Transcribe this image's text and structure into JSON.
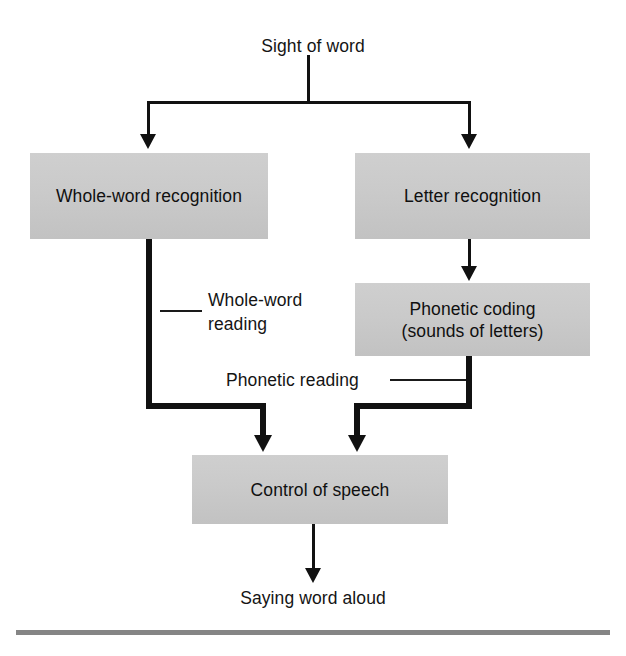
{
  "figure": {
    "type": "flowchart",
    "orientation": "top-to-bottom"
  },
  "top_caption_cut_off": "",
  "labels": {
    "input": "Sight of word",
    "output": "Saying word aloud",
    "route_left": "Whole-word\nreading",
    "route_right": "Phonetic reading"
  },
  "nodes": [
    {
      "id": "whole_word",
      "label": "Whole-word recognition"
    },
    {
      "id": "letter",
      "label": "Letter recognition"
    },
    {
      "id": "phonetic",
      "label": "Phonetic coding\n(sounds of letters)"
    },
    {
      "id": "control",
      "label": "Control of speech"
    }
  ],
  "edges": [
    {
      "from": "Sight of word",
      "to": "Whole-word recognition",
      "style": "thin"
    },
    {
      "from": "Sight of word",
      "to": "Letter recognition",
      "style": "thin"
    },
    {
      "from": "Letter recognition",
      "to": "Phonetic coding (sounds of letters)",
      "style": "thin"
    },
    {
      "from": "Whole-word recognition",
      "to": "Control of speech",
      "style": "thick",
      "label": "Whole-word reading"
    },
    {
      "from": "Phonetic coding (sounds of letters)",
      "to": "Control of speech",
      "style": "thick",
      "label": "Phonetic reading"
    },
    {
      "from": "Control of speech",
      "to": "Saying word aloud",
      "style": "thin"
    }
  ],
  "colors": {
    "box_fill": "#c9c9c9",
    "box_shadow": "#c9c9c9",
    "line": "#111111",
    "text": "#121212",
    "background": "#ffffff",
    "bottom_rule": "#7b7b7b"
  }
}
